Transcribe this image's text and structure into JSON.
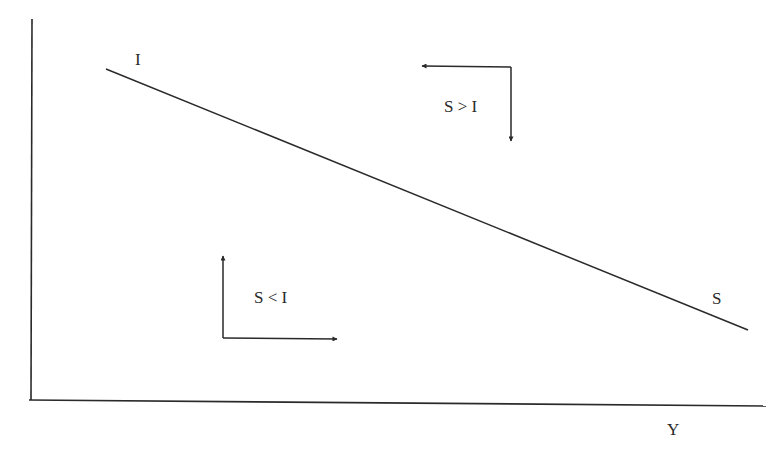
{
  "diagram": {
    "type": "economics-savings-investment-diagram",
    "axes": {
      "x_label": "Y",
      "y_label": ""
    },
    "line": {
      "start_label": "I",
      "end_label": "S"
    },
    "regions": [
      {
        "label": "S > I",
        "arrows": [
          "left",
          "down"
        ]
      },
      {
        "label": "S < I",
        "arrows": [
          "up",
          "right"
        ]
      }
    ]
  },
  "colors": {
    "ink": "#2a2a2a",
    "background": "#ffffff"
  }
}
